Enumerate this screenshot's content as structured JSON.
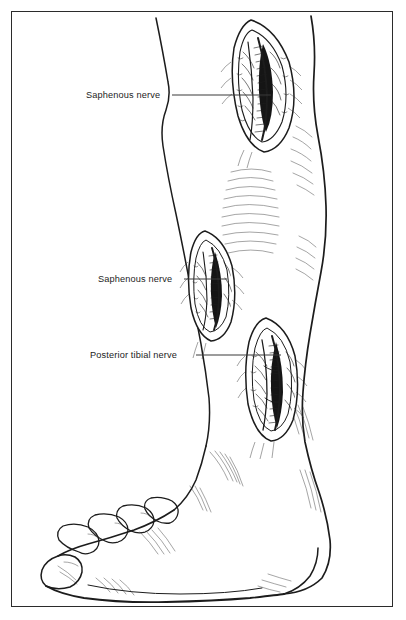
{
  "figure": {
    "style": "pen-and-ink line drawing",
    "background_color": "#ffffff",
    "ink_color": "#1c1c1c",
    "frame": {
      "visible": true,
      "color": "#2b2b2b",
      "inset_px": 11,
      "stroke_width": 1.2
    }
  },
  "labels": [
    {
      "id": "label-saphenous-upper",
      "text": "Saphenous nerve",
      "text_x": 86,
      "text_y": 98,
      "leader": {
        "x1": 172,
        "y1": 95,
        "x2": 271,
        "y2": 95
      },
      "target": "upper-incision"
    },
    {
      "id": "label-saphenous-middle",
      "text": "Saphenous nerve",
      "text_x": 98,
      "text_y": 282,
      "leader": {
        "x1": 184,
        "y1": 279,
        "x2": 227,
        "y2": 279
      },
      "target": "middle-incision"
    },
    {
      "id": "label-posterior-tibial",
      "text": "Posterior tibial nerve",
      "text_x": 90,
      "text_y": 358,
      "leader": {
        "x1": 196,
        "y1": 355,
        "x2": 281,
        "y2": 355
      },
      "target": "lower-incision"
    }
  ],
  "incisions": [
    {
      "id": "upper-incision",
      "name": "proximal medial leg incision",
      "center_x": 259,
      "center_y": 83,
      "length": 132,
      "width": 55,
      "tilt_deg": 8,
      "contents": "saphenous nerve and great saphenous vein with surrounding fascia"
    },
    {
      "id": "middle-incision",
      "name": "mid medial leg incision",
      "center_x": 210,
      "center_y": 285,
      "length": 108,
      "width": 44,
      "tilt_deg": -3,
      "contents": "saphenous nerve in distal calf"
    },
    {
      "id": "lower-incision",
      "name": "retromalleolar tarsal tunnel incision",
      "center_x": 270,
      "center_y": 378,
      "length": 118,
      "width": 48,
      "tilt_deg": 4,
      "contents": "posterior tibial nerve behind medial malleolus"
    }
  ],
  "anatomy": {
    "regions": [
      {
        "id": "knee-thigh",
        "label": "distal thigh and knee"
      },
      {
        "id": "calf",
        "label": "calf with gastrocnemius shading"
      },
      {
        "id": "tibial-crest",
        "label": "anterior tibial border"
      },
      {
        "id": "ankle",
        "label": "ankle and medial malleolus"
      },
      {
        "id": "foot",
        "label": "foot in profile"
      },
      {
        "id": "toes",
        "label": "five toes"
      },
      {
        "id": "heel",
        "label": "heel pad"
      }
    ],
    "toe_count": 5
  }
}
